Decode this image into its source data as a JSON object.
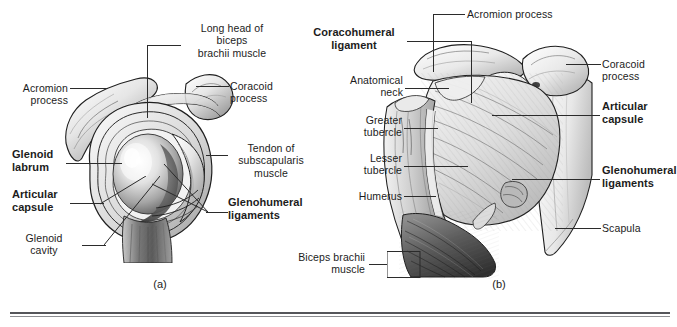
{
  "figure": {
    "caption_a": "(a)",
    "caption_b": "(b)",
    "divider": {
      "color_top": "#55565a",
      "color_bottom": "#8d8e92"
    },
    "ink_color": "#1f1f1f",
    "text_color": "#1c1c1c"
  },
  "panel_a": {
    "view": "lateral view of glenoid cavity with humerus removed",
    "caption": "(a)",
    "labels": [
      {
        "id": "long-head-biceps",
        "text": "Long head of\nbiceps\nbrachii muscle",
        "bold": false,
        "align": "center"
      },
      {
        "id": "acromion-process",
        "text": "Acromion\nprocess",
        "bold": false,
        "align": "right"
      },
      {
        "id": "coracoid-process",
        "text": "Coracoid\nprocess",
        "bold": false,
        "align": "left"
      },
      {
        "id": "glenoid-labrum",
        "text": "Glenoid\nlabrum",
        "bold": true,
        "align": "left"
      },
      {
        "id": "tendon-subscapularis",
        "text": "Tendon of\nsubscapularis\nmuscle",
        "bold": false,
        "align": "center"
      },
      {
        "id": "articular-capsule",
        "text": "Articular\ncapsule",
        "bold": true,
        "align": "left"
      },
      {
        "id": "glenohumeral-ligaments",
        "text": "Glenohumeral\nligaments",
        "bold": true,
        "align": "left"
      },
      {
        "id": "glenoid-cavity",
        "text": "Glenoid\ncavity",
        "bold": false,
        "align": "center"
      }
    ]
  },
  "panel_b": {
    "view": "anterior view of shoulder joint",
    "caption": "(b)",
    "labels": [
      {
        "id": "acromion-process",
        "text": "Acromion process",
        "bold": false,
        "align": "left"
      },
      {
        "id": "coracohumeral-ligament",
        "text": "Coracohumeral\nligament",
        "bold": true,
        "align": "center"
      },
      {
        "id": "coracoid-process",
        "text": "Coracoid\nprocess",
        "bold": false,
        "align": "left"
      },
      {
        "id": "anatomical-neck",
        "text": "Anatomical\nneck",
        "bold": false,
        "align": "right"
      },
      {
        "id": "greater-tubercle",
        "text": "Greater\ntubercle",
        "bold": false,
        "align": "right"
      },
      {
        "id": "articular-capsule",
        "text": "Articular\ncapsule",
        "bold": true,
        "align": "left"
      },
      {
        "id": "lesser-tubercle",
        "text": "Lesser\ntubercle",
        "bold": false,
        "align": "right"
      },
      {
        "id": "glenohumeral-ligaments",
        "text": "Glenohumeral\nligaments",
        "bold": true,
        "align": "left"
      },
      {
        "id": "humerus",
        "text": "Humerus",
        "bold": false,
        "align": "right"
      },
      {
        "id": "scapula",
        "text": "Scapula",
        "bold": false,
        "align": "left"
      },
      {
        "id": "biceps-brachii-muscle",
        "text": "Biceps brachii\nmuscle",
        "bold": false,
        "align": "right"
      }
    ]
  }
}
